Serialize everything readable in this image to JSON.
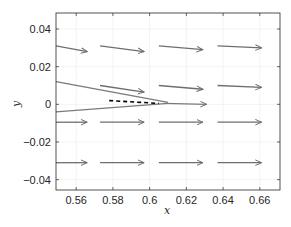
{
  "chart_data": {
    "type": "quiver",
    "title": "",
    "xlabel": "x",
    "ylabel": "y",
    "xlim": [
      0.549,
      0.671
    ],
    "ylim": [
      -0.0455,
      0.0485
    ],
    "xticks": [
      0.56,
      0.58,
      0.6,
      0.62,
      0.64,
      0.66
    ],
    "xtick_labels": [
      "0.56",
      "0.58",
      "0.6",
      "0.62",
      "0.64",
      "0.66"
    ],
    "yticks": [
      -0.04,
      -0.02,
      0,
      0.02,
      0.04
    ],
    "ytick_labels": [
      "−0.04",
      "−0.02",
      "0",
      "0.02",
      "0.04"
    ],
    "grid": true,
    "legend": null,
    "arrows": [
      {
        "x0": 0.549,
        "y0": 0.031,
        "x1": 0.566,
        "y1": 0.028
      },
      {
        "x0": 0.573,
        "y0": 0.031,
        "x1": 0.597,
        "y1": 0.028
      },
      {
        "x0": 0.605,
        "y0": 0.031,
        "x1": 0.629,
        "y1": 0.029
      },
      {
        "x0": 0.637,
        "y0": 0.031,
        "x1": 0.661,
        "y1": 0.03
      },
      {
        "x0": 0.573,
        "y0": 0.01,
        "x1": 0.597,
        "y1": 0.0065
      },
      {
        "x0": 0.605,
        "y0": 0.01,
        "x1": 0.629,
        "y1": 0.008
      },
      {
        "x0": 0.637,
        "y0": 0.01,
        "x1": 0.661,
        "y1": 0.009
      },
      {
        "x0": 0.549,
        "y0": -0.0095,
        "x1": 0.566,
        "y1": -0.0095
      },
      {
        "x0": 0.573,
        "y0": -0.0095,
        "x1": 0.597,
        "y1": -0.0095
      },
      {
        "x0": 0.605,
        "y0": -0.0095,
        "x1": 0.629,
        "y1": -0.0095
      },
      {
        "x0": 0.637,
        "y0": -0.0095,
        "x1": 0.661,
        "y1": -0.0095
      },
      {
        "x0": 0.549,
        "y0": -0.031,
        "x1": 0.566,
        "y1": -0.031
      },
      {
        "x0": 0.573,
        "y0": -0.031,
        "x1": 0.597,
        "y1": -0.031
      },
      {
        "x0": 0.605,
        "y0": -0.031,
        "x1": 0.629,
        "y1": -0.031
      },
      {
        "x0": 0.637,
        "y0": -0.031,
        "x1": 0.661,
        "y1": -0.031
      }
    ],
    "lines": [
      {
        "name": "upper-trajectory",
        "style": "solid",
        "color": "#7a7a7a",
        "points": [
          [
            0.549,
            0.012
          ],
          [
            0.61,
            0.001
          ]
        ]
      },
      {
        "name": "lower-trajectory",
        "style": "solid",
        "color": "#7a7a7a",
        "points": [
          [
            0.549,
            -0.004
          ],
          [
            0.61,
            0.0005
          ]
        ]
      },
      {
        "name": "center-trajectory",
        "style": "solid-arrow",
        "color": "#7a7a7a",
        "points": [
          [
            0.608,
            0.0005
          ],
          [
            0.631,
            0.0
          ]
        ]
      },
      {
        "name": "reference-dashed",
        "style": "dashed",
        "color": "#000000",
        "points": [
          [
            0.578,
            0.002
          ],
          [
            0.605,
            0.0005
          ]
        ]
      }
    ],
    "colors": {
      "arrow": "#6e6e6e",
      "axis": "#262626",
      "grid": "#ebebeb",
      "dashed": "#111111"
    }
  }
}
